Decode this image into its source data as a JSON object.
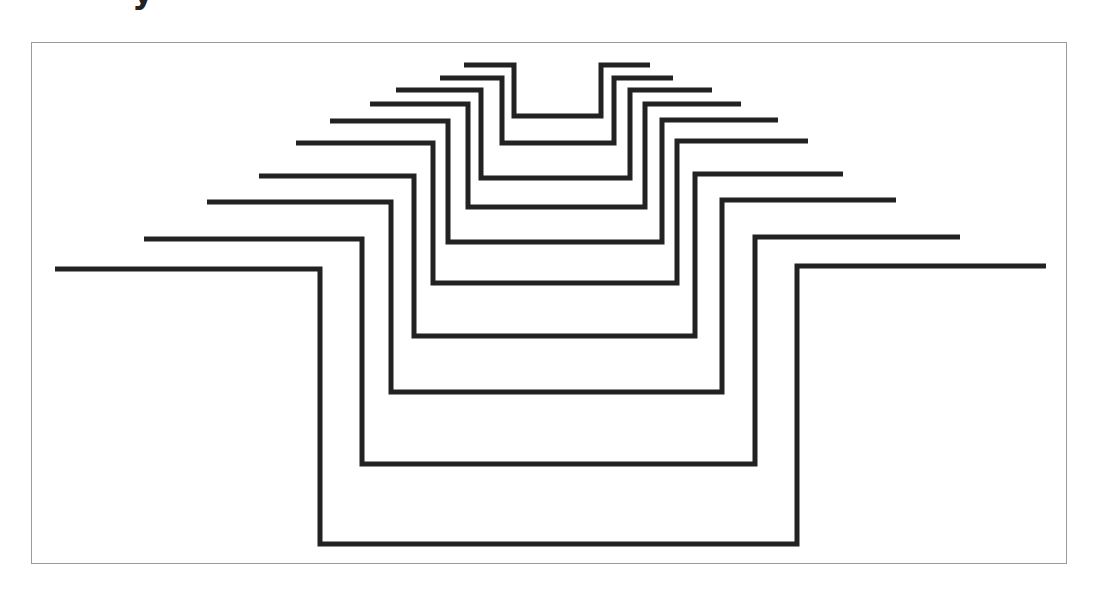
{
  "header": {
    "title_fragment": "y"
  },
  "diagram": {
    "type": "nested-stepped-u-lines",
    "stroke_color": "#222222",
    "stroke_width": 5,
    "frame_color": "#9a9a9a",
    "background_color": "#ffffff",
    "frame": {
      "x": 31,
      "y": 42,
      "width": 1036,
      "height": 522
    },
    "lines": [
      {
        "id": 1,
        "left_arm": {
          "x1": 464,
          "x2": 514,
          "y": 65
        },
        "right_arm": {
          "x1": 601,
          "x2": 650,
          "y": 65
        },
        "bottom_y": 116
      },
      {
        "id": 2,
        "left_arm": {
          "x1": 440,
          "x2": 502,
          "y": 78
        },
        "right_arm": {
          "x1": 614,
          "x2": 673,
          "y": 78
        },
        "bottom_y": 143
      },
      {
        "id": 3,
        "left_arm": {
          "x1": 396,
          "x2": 481,
          "y": 90
        },
        "right_arm": {
          "x1": 630,
          "x2": 712,
          "y": 90
        },
        "bottom_y": 178
      },
      {
        "id": 4,
        "left_arm": {
          "x1": 370,
          "x2": 468,
          "y": 104
        },
        "right_arm": {
          "x1": 645,
          "x2": 741,
          "y": 104
        },
        "bottom_y": 207
      },
      {
        "id": 5,
        "left_arm": {
          "x1": 330,
          "x2": 448,
          "y": 121
        },
        "right_arm": {
          "x1": 662,
          "x2": 778,
          "y": 120
        },
        "bottom_y": 242
      },
      {
        "id": 6,
        "left_arm": {
          "x1": 296,
          "x2": 433,
          "y": 143
        },
        "right_arm": {
          "x1": 677,
          "x2": 808,
          "y": 141
        },
        "bottom_y": 283
      },
      {
        "id": 7,
        "left_arm": {
          "x1": 259,
          "x2": 414,
          "y": 176
        },
        "right_arm": {
          "x1": 695,
          "x2": 843,
          "y": 174
        },
        "bottom_y": 336
      },
      {
        "id": 8,
        "left_arm": {
          "x1": 207,
          "x2": 391,
          "y": 202
        },
        "right_arm": {
          "x1": 722,
          "x2": 896,
          "y": 200
        },
        "bottom_y": 392
      },
      {
        "id": 9,
        "left_arm": {
          "x1": 144,
          "x2": 362,
          "y": 239
        },
        "right_arm": {
          "x1": 755,
          "x2": 960,
          "y": 237
        },
        "bottom_y": 464
      },
      {
        "id": 10,
        "left_arm": {
          "x1": 55,
          "x2": 320,
          "y": 269
        },
        "right_arm": {
          "x1": 797,
          "x2": 1046,
          "y": 266
        },
        "bottom_y": 544
      }
    ]
  }
}
